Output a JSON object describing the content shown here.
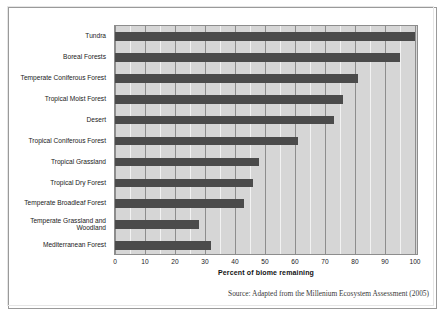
{
  "figure": {
    "source_note": "Source: Adapted from the Millenium Ecosystem Assessment (2005)",
    "frame_color": "#9a9a9a",
    "plot_background": "#d6d6d6",
    "bar_color": "#4b4b4b",
    "gridline_color": "#8d8d8d"
  },
  "chart_data": {
    "type": "bar",
    "orientation": "horizontal",
    "title": "",
    "xlabel": "Percent of biome remaining",
    "ylabel": "",
    "xlim": [
      0,
      100
    ],
    "xticks": [
      0,
      10,
      20,
      30,
      40,
      50,
      60,
      70,
      80,
      90,
      100
    ],
    "xtick_labels": [
      "0",
      "10",
      "20",
      "30",
      "40",
      "50",
      "60",
      "70",
      "80",
      "90",
      "100"
    ],
    "grid": true,
    "legend": false,
    "categories": [
      "Tundra",
      "Boreal Forests",
      "Temperate Coniferous Forest",
      "Tropical Moist Forest",
      "Desert",
      "Tropical Coniferous Forest",
      "Tropical Grassland",
      "Tropical Dry Forest",
      "Temperate Broadleaf Forest",
      "Temperate Grassland and\nWoodland",
      "Mediterranean Forest"
    ],
    "values": [
      100,
      95,
      81,
      76,
      73,
      61,
      48,
      46,
      43,
      28,
      32
    ]
  }
}
